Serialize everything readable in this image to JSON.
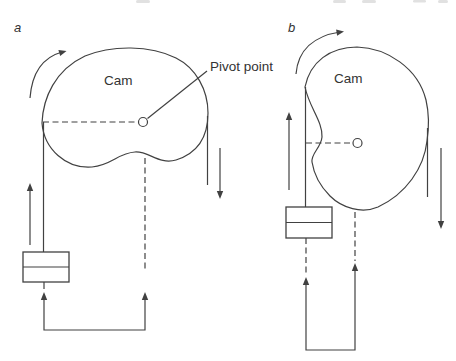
{
  "figure": {
    "background_color": "#ffffff",
    "line_color": "#414141",
    "text_color": "#333333",
    "panels": [
      {
        "label": "a",
        "cam_label": "Cam",
        "pivot_label": "Pivot point"
      },
      {
        "label": "b",
        "cam_label": "Cam"
      }
    ]
  }
}
